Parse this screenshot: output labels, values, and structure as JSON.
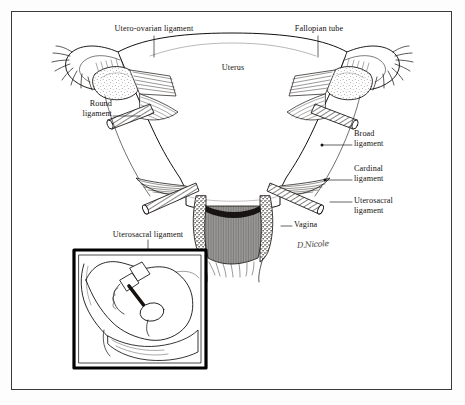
{
  "figure": {
    "background_color": "#ffffff",
    "frame_color": "#3a3a3a",
    "ink_color": "#14110f",
    "signature": "D.Nicole"
  },
  "labels": {
    "utero_ovarian_ligament": "Utero-ovarian ligament",
    "fallopian_tube": "Fallopian tube",
    "uterus": "Uterus",
    "round_ligament": "Round\nligament",
    "broad_ligament": "Broad\nligament",
    "cardinal_ligament": "Cardinal\nligament",
    "uterosacral_ligament": "Uterosacral\nligament",
    "vagina": "Vagina",
    "inset_uterosacral_ligament": "Uterosacral ligament"
  },
  "inset": {
    "caption": "Uterosacral ligament",
    "border_color": "#000000",
    "description": "Sagittal pelvic view showing the uterosacral ligament"
  },
  "structures": [
    {
      "name": "uterus-body",
      "label": "Uterus"
    },
    {
      "name": "fallopian-tube-left",
      "label": "Fallopian tube"
    },
    {
      "name": "fallopian-tube-right",
      "label": "Fallopian tube"
    },
    {
      "name": "ovary-left",
      "label": "Ovary"
    },
    {
      "name": "ovary-right",
      "label": "Ovary"
    },
    {
      "name": "round-ligament-left",
      "label": "Round ligament"
    },
    {
      "name": "round-ligament-right",
      "label": "Round ligament"
    },
    {
      "name": "broad-ligament-left",
      "label": "Broad ligament"
    },
    {
      "name": "broad-ligament-right",
      "label": "Broad ligament"
    },
    {
      "name": "cardinal-ligament-left",
      "label": "Cardinal ligament"
    },
    {
      "name": "cardinal-ligament-right",
      "label": "Cardinal ligament"
    },
    {
      "name": "uterosacral-ligament-left",
      "label": "Uterosacral ligament"
    },
    {
      "name": "uterosacral-ligament-right",
      "label": "Uterosacral ligament"
    },
    {
      "name": "vagina",
      "label": "Vagina"
    }
  ]
}
